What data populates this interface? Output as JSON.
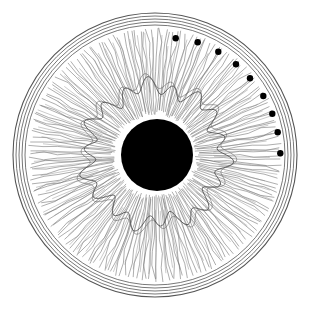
{
  "figure": {
    "width": 312,
    "height": 310,
    "background": "#ffffff",
    "ink": "#3a3a3a",
    "center": [
      155,
      155
    ],
    "outer_rings": {
      "radii": [
        142,
        139,
        136,
        133,
        130
      ],
      "stroke": "#555555"
    },
    "iris_fibers": {
      "inner_radius": 40,
      "outer_radius": 127,
      "count": 180,
      "collarette_radius": 68,
      "stroke": "#6a6a6a"
    },
    "pupil": {
      "center": [
        157,
        155
      ],
      "radius": 36,
      "fill": "#000000"
    },
    "dots": {
      "fill": "#000000",
      "radius": 3.2,
      "positions": [
        [
          175.7,
          38.3
        ],
        [
          197.7,
          42.3
        ],
        [
          218.3,
          51.7
        ],
        [
          236.0,
          64.3
        ],
        [
          250.0,
          78.3
        ],
        [
          263.3,
          96.0
        ],
        [
          272.3,
          113.7
        ],
        [
          277.7,
          132.3
        ],
        [
          280.3,
          153.3
        ]
      ]
    }
  }
}
